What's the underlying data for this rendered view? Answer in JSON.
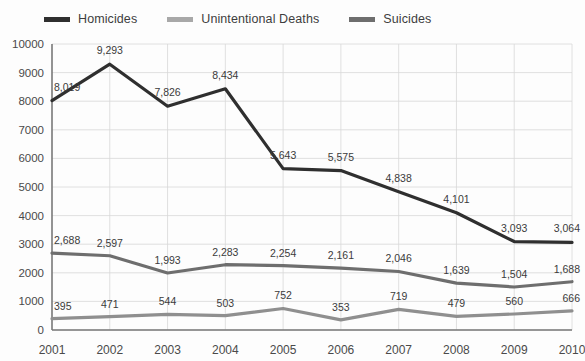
{
  "legend": {
    "position": "top-left",
    "items": [
      {
        "label": "Homicides",
        "color": "#2f2f2f",
        "swatch_name": "legend-swatch-homicides"
      },
      {
        "label": "Unintentional Deaths",
        "color": "#a8a8a8",
        "swatch_name": "legend-swatch-unintentional-deaths"
      },
      {
        "label": "Suicides",
        "color": "#6e6e6e",
        "swatch_name": "legend-swatch-suicides"
      }
    ]
  },
  "axes": {
    "y_ticks": [
      "10000",
      "9000",
      "8000",
      "7000",
      "6000",
      "5000",
      "4000",
      "3000",
      "2000",
      "1000",
      "0"
    ],
    "x_ticks": [
      "2001",
      "2002",
      "2003",
      "2004",
      "2005",
      "2006",
      "2007",
      "2008",
      "2009",
      "2010"
    ]
  },
  "chart_data": {
    "type": "line",
    "title": "",
    "subtitle": "",
    "xlabel": "",
    "ylabel": "",
    "ylim": [
      0,
      10000
    ],
    "ytick_step": 1000,
    "grid": true,
    "legend_position": "top-left",
    "categories": [
      "2001",
      "2002",
      "2003",
      "2004",
      "2005",
      "2006",
      "2007",
      "2008",
      "2009",
      "2010"
    ],
    "series": [
      {
        "name": "Homicides",
        "color": "#2f2f2f",
        "values": [
          8019,
          9293,
          7826,
          8434,
          5643,
          5575,
          4838,
          4101,
          3093,
          3064
        ],
        "labels": [
          "8,019",
          "9,293",
          "7,826",
          "8,434",
          "5,643",
          "5,575",
          "4,838",
          "4,101",
          "3,093",
          "3,064"
        ]
      },
      {
        "name": "Suicides",
        "color": "#6e6e6e",
        "values": [
          2688,
          2597,
          1993,
          2283,
          2254,
          2161,
          2046,
          1639,
          1504,
          1688
        ],
        "labels": [
          "2,688",
          "2,597",
          "1,993",
          "2,283",
          "2,254",
          "2,161",
          "2,046",
          "1,639",
          "1,504",
          "1,688"
        ]
      },
      {
        "name": "Unintentional Deaths",
        "color": "#8f8f8f",
        "values": [
          395,
          471,
          544,
          503,
          752,
          353,
          719,
          479,
          560,
          666
        ],
        "labels": [
          "395",
          "471",
          "544",
          "503",
          "752",
          "353",
          "719",
          "479",
          "560",
          "666"
        ]
      }
    ]
  }
}
